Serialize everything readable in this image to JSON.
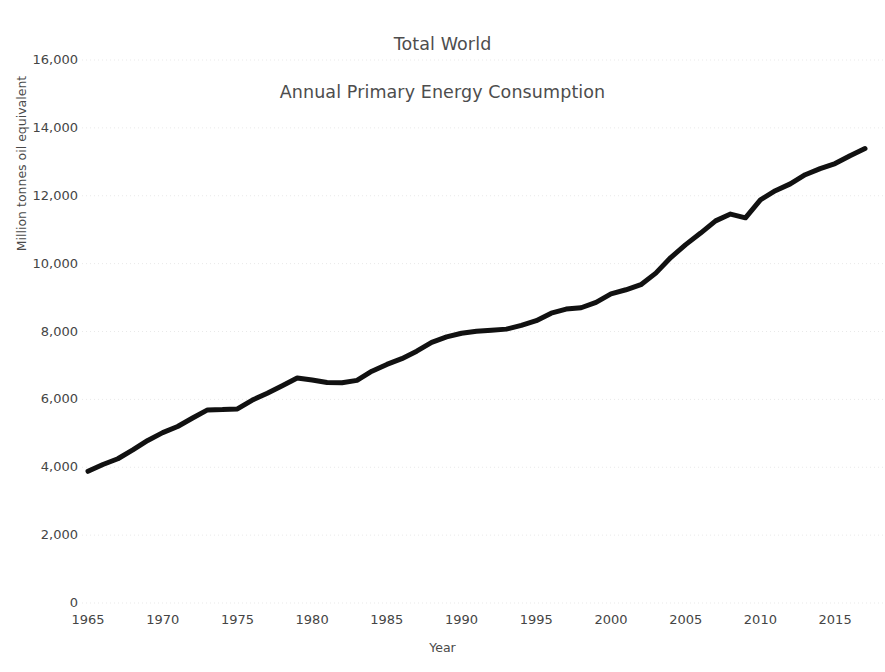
{
  "chart_data": {
    "type": "line",
    "title": "Total World\nAnnual Primary Energy Consumption",
    "title_lines": [
      "Total World",
      "Annual Primary Energy Consumption"
    ],
    "xlabel": "Year",
    "ylabel": "Million tonnes oil equivalent",
    "xlim": [
      1965,
      2017
    ],
    "ylim": [
      0,
      16000
    ],
    "xticks": [
      1965,
      1970,
      1975,
      1980,
      1985,
      1990,
      1995,
      2000,
      2005,
      2010,
      2015
    ],
    "xtick_labels": [
      "1965",
      "1970",
      "1975",
      "1980",
      "1985",
      "1990",
      "1995",
      "2000",
      "2005",
      "2010",
      "2015"
    ],
    "yticks": [
      0,
      2000,
      4000,
      6000,
      8000,
      10000,
      12000,
      14000,
      16000
    ],
    "ytick_labels": [
      "0",
      "2,000",
      "4,000",
      "6,000",
      "8,000",
      "10,000",
      "12,000",
      "14,000",
      "16,000"
    ],
    "grid": true,
    "grid_style": "dotted",
    "legend": null,
    "line_color": "#111111",
    "line_width": 5,
    "series": [
      {
        "name": "Total World Primary Energy Consumption",
        "x": [
          1965,
          1966,
          1967,
          1968,
          1969,
          1970,
          1971,
          1972,
          1973,
          1974,
          1975,
          1976,
          1977,
          1978,
          1979,
          1980,
          1981,
          1982,
          1983,
          1984,
          1985,
          1986,
          1987,
          1988,
          1989,
          1990,
          1991,
          1992,
          1993,
          1994,
          1995,
          1996,
          1997,
          1998,
          1999,
          2000,
          2001,
          2002,
          2003,
          2004,
          2005,
          2006,
          2007,
          2008,
          2009,
          2010,
          2011,
          2012,
          2013,
          2014,
          2015,
          2016,
          2017
        ],
        "values": [
          3880,
          4080,
          4250,
          4510,
          4790,
          5020,
          5200,
          5450,
          5690,
          5700,
          5720,
          5980,
          6180,
          6400,
          6630,
          6570,
          6500,
          6490,
          6560,
          6830,
          7030,
          7200,
          7420,
          7680,
          7840,
          7950,
          8010,
          8040,
          8070,
          8180,
          8320,
          8540,
          8660,
          8700,
          8860,
          9110,
          9230,
          9380,
          9720,
          10180,
          10560,
          10900,
          11260,
          11460,
          11350,
          11880,
          12150,
          12350,
          12620,
          12800,
          12950,
          13180,
          13390
        ]
      }
    ]
  },
  "axes": {
    "ylabel": "Million tonnes oil equivalent",
    "xlabel": "Year"
  }
}
